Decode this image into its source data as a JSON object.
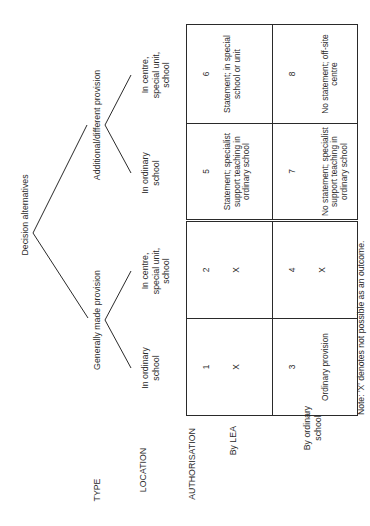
{
  "diagram": {
    "title": "Decision alternatives",
    "row_headers": {
      "type": "TYPE",
      "location": "LOCATION",
      "authorisation": "AUTHORISATION",
      "by_lea": "By LEA",
      "by_ordinary_school": "By ordinary school"
    },
    "types": [
      {
        "label": "Generally made provision",
        "locations": [
          "In ordinary school",
          "In centre, special unit, school"
        ]
      },
      {
        "label": "Additional/different provision",
        "locations": [
          "In ordinary school",
          "In centre, special unit, school"
        ]
      }
    ],
    "cells": [
      {
        "num": "1",
        "text": "X"
      },
      {
        "num": "2",
        "text": "X"
      },
      {
        "num": "5",
        "text": "Statement; specialist support teaching in ordinary school"
      },
      {
        "num": "6",
        "text": "Statement; in special school or unit"
      },
      {
        "num": "3",
        "text": "Ordinary provision"
      },
      {
        "num": "4",
        "text": "X"
      },
      {
        "num": "7",
        "text": "No statement; specialist support teaching in ordinary school"
      },
      {
        "num": "8",
        "text": "No statement; off-site centre"
      }
    ],
    "note": "Note: 'X' denotes not possible as an outcome."
  }
}
